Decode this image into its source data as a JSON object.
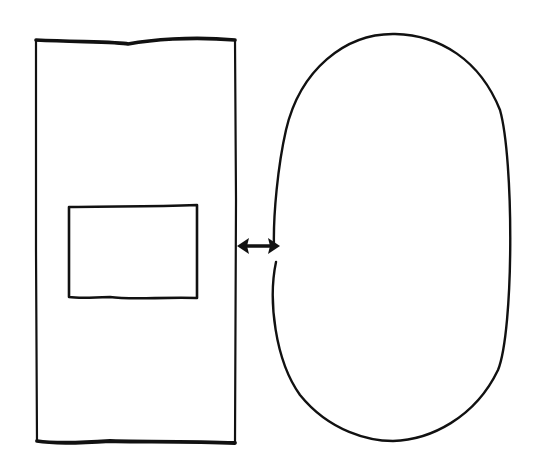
{
  "diagram": {
    "title": "",
    "background": "#ffffff",
    "stroke_color": "#111111",
    "style": "hand-drawn sketch",
    "shapes": [
      {
        "id": "outer-rectangle",
        "type": "rectangle",
        "x": 36,
        "y": 36,
        "width": 199,
        "height": 407,
        "label": ""
      },
      {
        "id": "inner-rectangle",
        "type": "rectangle",
        "x": 68,
        "y": 206,
        "width": 130,
        "height": 92,
        "label": ""
      },
      {
        "id": "ellipse",
        "type": "ellipse",
        "cx": 392,
        "cy": 238,
        "rx": 121,
        "ry": 204,
        "label": ""
      }
    ],
    "connectors": [
      {
        "id": "double-arrow",
        "type": "bidirectional-arrow",
        "from": "outer-rectangle",
        "to": "ellipse",
        "x1": 237,
        "y1": 246,
        "x2": 279,
        "y2": 246,
        "label": ""
      }
    ]
  }
}
